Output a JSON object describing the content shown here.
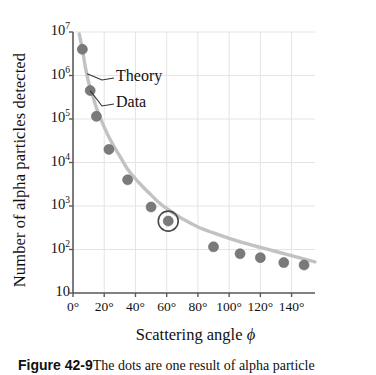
{
  "chart_data": {
    "type": "scatter",
    "title": "",
    "xlabel": "Scattering angle ϕ",
    "ylabel": "Number of alpha particles detected",
    "xlim": [
      0,
      155
    ],
    "ylim": [
      10,
      10000000
    ],
    "yscale": "log",
    "xscale": "linear",
    "grid": true,
    "legend_position": "inline-annotations",
    "xticks": [
      "0°",
      "20°",
      "40°",
      "60°",
      "80°",
      "100°",
      "120°",
      "140°"
    ],
    "xtick_values": [
      0,
      20,
      40,
      60,
      80,
      100,
      120,
      140
    ],
    "yticks": [
      "10",
      "10²",
      "10³",
      "10⁴",
      "10⁵",
      "10⁶",
      "10⁷"
    ],
    "ytick_values": [
      10,
      100,
      1000,
      10000,
      100000,
      1000000,
      10000000
    ],
    "ytick_mantissa": [
      "10",
      "10",
      "10",
      "10",
      "10",
      "10",
      "10"
    ],
    "ytick_exponent": [
      "",
      "2",
      "3",
      "4",
      "5",
      "6",
      "7"
    ],
    "series": [
      {
        "name": "Theory",
        "kind": "line",
        "color": "#c2c2c2",
        "x": [
          4,
          6,
          8,
          10,
          12,
          15,
          18,
          22,
          26,
          30,
          35,
          40,
          45,
          50,
          55,
          60,
          65,
          70,
          80,
          90,
          100,
          110,
          120,
          130,
          140,
          150,
          155
        ],
        "y": [
          9000000,
          4000000,
          1500000,
          700000,
          400000,
          180000,
          95000,
          45000,
          24000,
          14000,
          7000,
          4200,
          2700,
          1800,
          1200,
          880,
          660,
          510,
          330,
          240,
          180,
          140,
          112,
          90,
          72,
          58,
          52
        ]
      },
      {
        "name": "Data",
        "kind": "markers",
        "color": "#7a7a7a",
        "x": [
          6,
          11,
          15,
          23,
          35,
          50,
          61,
          90,
          107,
          120,
          135,
          148
        ],
        "y": [
          4000000,
          450000,
          115000,
          20000,
          4000,
          950,
          450,
          115,
          80,
          65,
          50,
          44
        ]
      }
    ],
    "annotations": [
      {
        "id": "theory-annotation",
        "label": "Theory",
        "points_to_x": 9,
        "points_to_y": 1100000
      },
      {
        "id": "data-annotation",
        "label": "Data",
        "points_to_x": 11,
        "points_to_y": 450000
      },
      {
        "id": "highlight-circle",
        "label": "",
        "points_to_x": 61,
        "points_to_y": 450
      }
    ]
  },
  "caption": {
    "figure_number": "Figure 42-9",
    "text": "The dots are one result of alpha particle"
  },
  "style": {
    "marker_color": "#7a7a7a",
    "curve_color": "#c2c2c2",
    "grid_color": "#e4e4e4",
    "axis_color": "#5a5a5a",
    "text_color": "#111111",
    "background": "#ffffff"
  }
}
